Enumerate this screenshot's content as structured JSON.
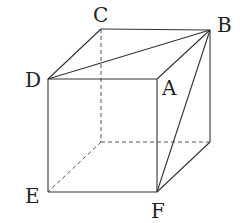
{
  "figure": {
    "type": "cube-perspective",
    "colors": {
      "line": "#333333",
      "hidden_line": "#555555",
      "label": "#222222",
      "background": "#ffffff"
    },
    "vertices": {
      "A": {
        "label": "A",
        "x": 157,
        "y": 79
      },
      "B": {
        "label": "B",
        "x": 210,
        "y": 30
      },
      "C": {
        "label": "C",
        "x": 101,
        "y": 29
      },
      "D": {
        "label": "D",
        "x": 48,
        "y": 79
      },
      "E": {
        "label": "E",
        "x": 48,
        "y": 192
      },
      "F": {
        "label": "F",
        "x": 157,
        "y": 192
      },
      "G": {
        "label": "",
        "x": 101,
        "y": 142
      },
      "H": {
        "label": "",
        "x": 210,
        "y": 142
      }
    },
    "solid_edges": [
      [
        "D",
        "A"
      ],
      [
        "D",
        "C"
      ],
      [
        "C",
        "B"
      ],
      [
        "A",
        "B"
      ],
      [
        "D",
        "E"
      ],
      [
        "A",
        "F"
      ],
      [
        "E",
        "F"
      ],
      [
        "B",
        "H"
      ],
      [
        "F",
        "H"
      ]
    ],
    "hidden_edges": [
      [
        "C",
        "G"
      ],
      [
        "G",
        "E"
      ],
      [
        "G",
        "H"
      ]
    ],
    "diagonals": [
      [
        "D",
        "B"
      ],
      [
        "B",
        "F"
      ]
    ],
    "labels": {
      "A": "A",
      "B": "B",
      "C": "C",
      "D": "D",
      "E": "E",
      "F": "F"
    }
  }
}
